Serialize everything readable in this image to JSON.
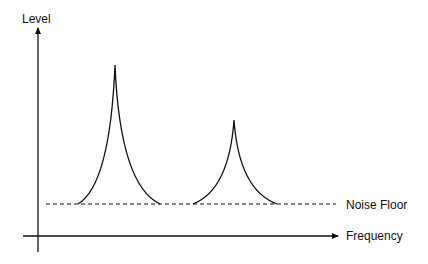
{
  "diagram": {
    "title": "",
    "y_axis_label": "Level",
    "x_axis_label": "Frequency",
    "noise_floor_label": "Noise Floor",
    "line_color": "#111111",
    "peaks": [
      {
        "name": "peak-1",
        "apex_x": 115,
        "apex_y": 65,
        "base_left": 78,
        "base_right": 160
      },
      {
        "name": "peak-2",
        "apex_x": 234,
        "apex_y": 120,
        "base_left": 193,
        "base_right": 277
      }
    ],
    "noise_floor_y": 204
  }
}
